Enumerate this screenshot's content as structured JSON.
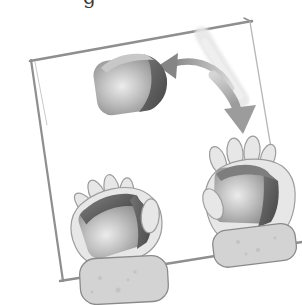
{
  "caption_fragment": "g",
  "illustration": {
    "scene_icons": [
      "board-frame",
      "motion-swoosh",
      "curved-arrow-left-icon",
      "curved-arrow-down-icon",
      "airborne-cube-icon",
      "right-hand",
      "cube-in-right-hand-icon",
      "right-sleeve",
      "left-hand",
      "cube-in-left-hand-icon",
      "left-sleeve"
    ]
  },
  "colors": {
    "background": "#ffffff",
    "text": "#3a3a3a",
    "frame": "#8f8f8f",
    "frame_light": "#b8b8b8",
    "frame_echo": "#b2b2b2",
    "hand_fill": "#e7e7e7",
    "hand_stroke": "#9c9c9c",
    "sleeve_fill": "#d3d3d3",
    "sleeve_stroke": "#8a8a8a",
    "sleeve_dot": "#6f6f6f",
    "cube_highlight": "#ececec",
    "cube_light": "#c4c4c4",
    "cube_mid": "#969696",
    "cube_edge": "#868686",
    "cube_dark1": "#7a7a7a",
    "cube_dark2": "#454545",
    "cube_top": "#c8c8c8",
    "cube_top_dark": "#7e7e7e",
    "arrow_dark": "#858585",
    "arrow_mid": "#9c9c9c",
    "arrow_light": "#d6d6d6",
    "swoosh": "#e7e7e7",
    "swoosh_core": "#efefef"
  }
}
